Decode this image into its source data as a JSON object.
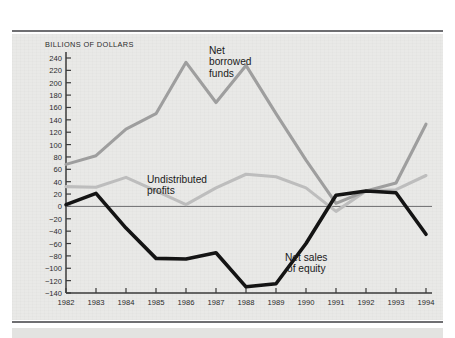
{
  "figure": {
    "y_axis_title": "BILLIONS OF DOLLARS",
    "background_color": "#e9e9e7",
    "rule_color": "#6f6f72"
  },
  "labels": {
    "net_borrowed_funds": "Net\nborrowed\nfunds",
    "undistributed_profits": "Undistributed\nprofits",
    "net_sales_of_equity": "Net sales\nof equity"
  },
  "chart_data": {
    "type": "line",
    "title": "",
    "subtitle": "",
    "xlabel": "",
    "ylabel": "BILLIONS OF DOLLARS",
    "x": [
      1982,
      1983,
      1984,
      1985,
      1986,
      1987,
      1988,
      1989,
      1990,
      1991,
      1992,
      1993,
      1994
    ],
    "categories": [
      "1982",
      "1983",
      "1984",
      "1985",
      "1986",
      "1987",
      "1988",
      "1989",
      "1990",
      "1991",
      "1992",
      "1993",
      "1994"
    ],
    "xlim": [
      1982,
      1994
    ],
    "ylim": [
      -140,
      240
    ],
    "ytick_step": 20,
    "yticks": [
      240,
      220,
      200,
      180,
      160,
      140,
      120,
      100,
      80,
      60,
      40,
      20,
      0,
      -20,
      -40,
      -60,
      -80,
      -100,
      -120,
      -140
    ],
    "ytick_labels": [
      "240",
      "220",
      "200",
      "180",
      "160",
      "140",
      "120",
      "100",
      "80",
      "60",
      "40",
      "20",
      "0",
      "−20",
      "−40",
      "−60",
      "−80",
      "−100",
      "−120",
      "−140"
    ],
    "grid": false,
    "zero_line": true,
    "legend": "inline-annotations",
    "series": [
      {
        "name": "Net borrowed funds",
        "color": "#9e9e9e",
        "width": 3.1,
        "values": [
          68,
          82,
          125,
          150,
          233,
          168,
          228,
          150,
          75,
          5,
          25,
          38,
          133
        ]
      },
      {
        "name": "Undistributed profits",
        "color": "#bdbdbd",
        "width": 3.1,
        "values": [
          32,
          31,
          47,
          25,
          3,
          30,
          52,
          48,
          30,
          -8,
          25,
          27,
          50
        ]
      },
      {
        "name": "Net sales of equity",
        "color": "#141414",
        "width": 3.6,
        "values": [
          3,
          21,
          -35,
          -84,
          -85,
          -75,
          -130,
          -125,
          -60,
          18,
          25,
          22,
          -45
        ]
      }
    ]
  }
}
